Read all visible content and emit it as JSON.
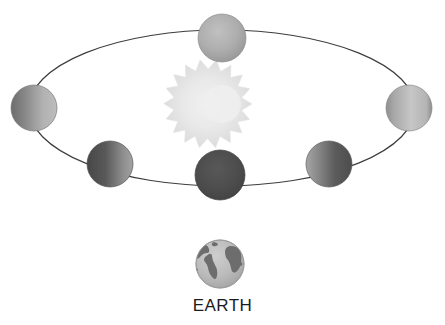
{
  "figure": {
    "title": "",
    "type": "astronomy-orbit-diagram",
    "background_color": "#ffffff"
  },
  "orbit": {
    "name": "moon-orbit-ellipse",
    "center_x": 222,
    "center_y": 108,
    "radius_x": 193,
    "radius_y": 78,
    "stroke_color": "#3d3d3d",
    "stroke_width": 1.2,
    "fill": "none"
  },
  "sun": {
    "name": "sun-star",
    "center_x": 222,
    "center_y": 104,
    "outer_radius": 30,
    "inner_radius": 20,
    "ray_count": 20,
    "fill_center_color": "#efefef",
    "fill_edge_color": "#dcdcdc",
    "stroke_color": "#e2e2e2"
  },
  "moons": [
    {
      "name": "moon-phase-top",
      "phase": "full",
      "center_x": 222,
      "center_y": 38,
      "radius": 24,
      "lit_side": "all",
      "light_color": "#b4b4b4",
      "dark_color": "#9a9a9a",
      "edge_color": "#8e8e8e"
    },
    {
      "name": "moon-phase-right",
      "phase": "waxing",
      "center_x": 409,
      "center_y": 108,
      "radius": 23,
      "lit_side": "right",
      "light_color": "#c2c2c2",
      "dark_color": "#7e7e7e",
      "edge_color": "#8a8a8a"
    },
    {
      "name": "moon-phase-lower-right",
      "phase": "waning-gibbous",
      "center_x": 329,
      "center_y": 164,
      "radius": 23,
      "lit_side": "left",
      "light_color": "#9e9e9e",
      "dark_color": "#565656",
      "edge_color": "#5e5e5e"
    },
    {
      "name": "moon-phase-bottom",
      "phase": "new",
      "center_x": 220,
      "center_y": 175,
      "radius": 25,
      "lit_side": "none",
      "light_color": "#535353",
      "dark_color": "#454545",
      "edge_color": "#4a4a4a"
    },
    {
      "name": "moon-phase-lower-left",
      "phase": "waxing-gibbous",
      "center_x": 110,
      "center_y": 164,
      "radius": 23,
      "lit_side": "right",
      "light_color": "#9a9a9a",
      "dark_color": "#4f4f4f",
      "edge_color": "#585858"
    },
    {
      "name": "moon-phase-left",
      "phase": "waning",
      "center_x": 34,
      "center_y": 108,
      "radius": 23,
      "lit_side": "right",
      "light_color": "#b0b0b0",
      "dark_color": "#6f6f6f",
      "edge_color": "#7a7a7a"
    }
  ],
  "earth": {
    "name": "earth-globe",
    "center_x": 220,
    "center_y": 264,
    "radius": 24,
    "ocean_color": "#b9b9b9",
    "land_color": "#6d6d6d",
    "outline_color": "#8a8a8a",
    "label": "EARTH",
    "label_color": "#1c1c1c"
  }
}
